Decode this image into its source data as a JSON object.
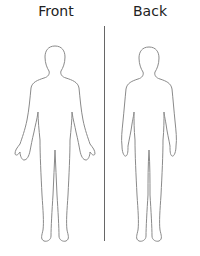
{
  "labels": {
    "front": "Front",
    "back": "Back"
  },
  "colors": {
    "outline": "#8a8a8a",
    "divider": "#666666",
    "text": "#222222",
    "background": "#ffffff"
  }
}
